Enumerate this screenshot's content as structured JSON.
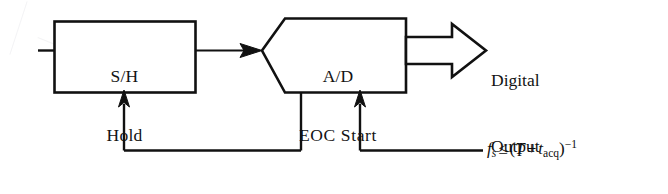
{
  "figure": {
    "type": "block-diagram",
    "background_color": "#ffffff",
    "stroke_color": "#111111",
    "blocks": [
      {
        "id": "sample-hold",
        "shape": "rectangle",
        "line1": "S/H",
        "line2": "Hold"
      },
      {
        "id": "ad-converter",
        "shape": "pentagon-pointed-left",
        "line1": "A/D",
        "line2": "EOC Start"
      }
    ],
    "output": {
      "arrow": "hollow-block-arrow-right",
      "line1": "Digital",
      "line2": "Output"
    },
    "formula": {
      "symbol": "f",
      "symbol_sub": "s",
      "relation": "≤",
      "open_paren": "(",
      "term1": "T",
      "plus": "+",
      "term2": "t",
      "term2_sub": "acq",
      "close_paren": ")",
      "exponent": "−1",
      "plain_text": "fₛ ≤ (T + t_acq)⁻¹"
    },
    "signals": [
      {
        "id": "analog-input-stub",
        "label": ""
      },
      {
        "id": "sh-to-ad",
        "label": "",
        "arrowhead": "solid"
      },
      {
        "id": "sample-clock-to-sh",
        "label": "",
        "arrowhead": "solid-up"
      },
      {
        "id": "eoc-from-ad",
        "label": "",
        "arrowhead": "none"
      },
      {
        "id": "start-to-ad",
        "label": "",
        "arrowhead": "solid-up"
      }
    ]
  }
}
